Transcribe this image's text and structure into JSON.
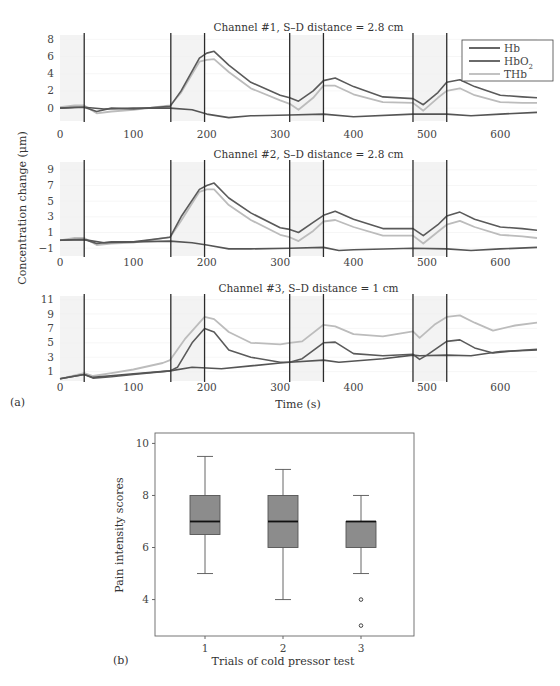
{
  "figure": {
    "panel_a_label": "(a)",
    "panel_b_label": "(b)"
  },
  "chart_data": [
    {
      "type": "line",
      "panel": "a",
      "title": "Channel #1, S–D distance = 2.8 cm",
      "xlabel": "Time (s)",
      "ylabel": "Concentration change (μm)",
      "xlim": [
        0,
        650
      ],
      "ylim": [
        -1.5,
        8.5
      ],
      "xticks": [
        0,
        100,
        200,
        300,
        400,
        500,
        600
      ],
      "yticks": [
        0,
        2,
        4,
        6,
        8
      ],
      "grid": false,
      "vlines": [
        33,
        151,
        197,
        313,
        359,
        481,
        527
      ],
      "shaded_regions": [
        [
          0,
          33
        ],
        [
          151,
          197
        ],
        [
          313,
          359
        ],
        [
          481,
          527
        ]
      ],
      "legend": {
        "position": "upper right",
        "entries": [
          "Hb",
          "HbO2",
          "THb"
        ]
      },
      "series": [
        {
          "name": "Hb",
          "color": "#555555",
          "x": [
            0,
            33,
            60,
            100,
            150,
            180,
            200,
            230,
            260,
            313,
            359,
            400,
            481,
            527,
            560,
            600,
            650
          ],
          "y": [
            0,
            0.1,
            -0.1,
            0,
            0,
            -0.2,
            -0.7,
            -1.1,
            -0.9,
            -0.8,
            -0.7,
            -1.0,
            -0.7,
            -0.7,
            -0.9,
            -0.7,
            -0.5
          ]
        },
        {
          "name": "HbO2",
          "color": "#5a5a5a",
          "x": [
            0,
            20,
            33,
            50,
            70,
            100,
            150,
            165,
            190,
            200,
            210,
            230,
            260,
            300,
            313,
            325,
            345,
            359,
            375,
            400,
            440,
            481,
            495,
            515,
            527,
            545,
            565,
            600,
            630,
            650
          ],
          "y": [
            0,
            0.1,
            0.1,
            -0.4,
            0,
            -0.1,
            0.2,
            2.0,
            5.8,
            6.4,
            6.6,
            5.0,
            3.0,
            1.5,
            1.2,
            0.8,
            2.0,
            3.2,
            3.5,
            2.5,
            1.3,
            1.1,
            0.4,
            1.8,
            3.0,
            3.3,
            2.5,
            1.5,
            1.3,
            1.2
          ]
        },
        {
          "name": "THb",
          "color": "#bcbcbc",
          "x": [
            0,
            20,
            33,
            50,
            70,
            100,
            150,
            165,
            190,
            200,
            210,
            230,
            260,
            300,
            313,
            325,
            345,
            359,
            375,
            400,
            440,
            481,
            495,
            515,
            527,
            545,
            565,
            600,
            630,
            650
          ],
          "y": [
            0.1,
            0.3,
            0.3,
            -0.6,
            -0.4,
            -0.2,
            0.3,
            1.8,
            5.4,
            5.6,
            5.7,
            4.2,
            2.3,
            0.9,
            0.5,
            -0.2,
            1.2,
            2.6,
            2.6,
            1.6,
            0.7,
            0.6,
            -0.3,
            1.2,
            2.0,
            2.3,
            1.5,
            0.7,
            0.6,
            0.6
          ]
        }
      ]
    },
    {
      "type": "line",
      "panel": "a",
      "title": "Channel #2, S–D distance = 2.8 cm",
      "xlim": [
        0,
        650
      ],
      "ylim": [
        -2,
        10
      ],
      "xticks": [
        0,
        100,
        200,
        300,
        400,
        500,
        600
      ],
      "yticks": [
        -1,
        1,
        3,
        5,
        7,
        9
      ],
      "vlines": [
        33,
        151,
        197,
        313,
        359,
        481,
        527
      ],
      "shaded_regions": [
        [
          0,
          33
        ],
        [
          151,
          197
        ],
        [
          313,
          359
        ],
        [
          481,
          527
        ]
      ],
      "series": [
        {
          "name": "Hb",
          "color": "#555555",
          "x": [
            0,
            33,
            60,
            100,
            150,
            180,
            200,
            230,
            260,
            313,
            359,
            380,
            400,
            481,
            527,
            560,
            600,
            650
          ],
          "y": [
            0,
            0.1,
            -0.3,
            -0.2,
            -0.1,
            -0.3,
            -0.6,
            -1.1,
            -1.1,
            -1.0,
            -0.9,
            -1.3,
            -1.2,
            -1.0,
            -1.1,
            -1.3,
            -1.1,
            -0.9
          ]
        },
        {
          "name": "HbO2",
          "color": "#5a5a5a",
          "x": [
            0,
            20,
            33,
            50,
            70,
            100,
            150,
            165,
            190,
            200,
            210,
            230,
            260,
            300,
            313,
            325,
            345,
            359,
            375,
            400,
            440,
            481,
            495,
            515,
            527,
            545,
            565,
            600,
            630,
            650
          ],
          "y": [
            0,
            0.1,
            0.1,
            -0.4,
            -0.2,
            -0.2,
            0.4,
            3.0,
            6.5,
            7.0,
            7.3,
            5.4,
            3.5,
            1.6,
            1.4,
            1.0,
            2.3,
            3.2,
            3.7,
            2.7,
            1.5,
            1.5,
            0.6,
            2.0,
            3.1,
            3.6,
            2.7,
            1.7,
            1.5,
            1.3
          ]
        },
        {
          "name": "THb",
          "color": "#bcbcbc",
          "x": [
            0,
            20,
            33,
            50,
            70,
            100,
            150,
            165,
            190,
            200,
            210,
            230,
            260,
            300,
            313,
            325,
            345,
            359,
            375,
            400,
            440,
            481,
            495,
            515,
            527,
            545,
            565,
            600,
            630,
            650
          ],
          "y": [
            0,
            0.3,
            0.3,
            -0.6,
            -0.4,
            -0.3,
            0.4,
            2.5,
            6.2,
            6.5,
            6.5,
            4.5,
            2.6,
            0.7,
            0.4,
            -0.1,
            1.2,
            2.4,
            2.6,
            1.7,
            0.6,
            0.6,
            -0.4,
            1.1,
            2.0,
            2.5,
            1.7,
            0.7,
            0.5,
            0.3
          ]
        }
      ]
    },
    {
      "type": "line",
      "panel": "a",
      "title": "Channel #3, S–D distance = 1 cm",
      "xlim": [
        0,
        650
      ],
      "ylim": [
        -0.3,
        11.5
      ],
      "xticks": [
        0,
        100,
        200,
        300,
        400,
        500,
        600
      ],
      "yticks": [
        1,
        3,
        5,
        7,
        9,
        11
      ],
      "vlines": [
        33,
        151,
        197,
        313,
        359,
        481,
        527
      ],
      "shaded_regions": [
        [
          0,
          33
        ],
        [
          151,
          197
        ],
        [
          313,
          359
        ],
        [
          481,
          527
        ]
      ],
      "series": [
        {
          "name": "Hb",
          "color": "#555555",
          "x": [
            0,
            33,
            45,
            100,
            150,
            180,
            200,
            220,
            260,
            300,
            313,
            359,
            380,
            440,
            481,
            490,
            527,
            560,
            600,
            650
          ],
          "y": [
            0,
            0.6,
            0.2,
            0.7,
            1.1,
            1.6,
            1.5,
            1.4,
            1.8,
            2.2,
            2.3,
            2.6,
            2.3,
            2.8,
            3.3,
            3.2,
            3.3,
            3.2,
            3.8,
            4.0
          ]
        },
        {
          "name": "HbO2",
          "color": "#5a5a5a",
          "x": [
            0,
            33,
            45,
            70,
            100,
            150,
            160,
            180,
            197,
            210,
            230,
            260,
            300,
            313,
            330,
            359,
            375,
            400,
            440,
            481,
            490,
            500,
            527,
            545,
            565,
            590,
            620,
            650
          ],
          "y": [
            0,
            0.6,
            0.1,
            0.3,
            0.6,
            1.1,
            1.6,
            5.0,
            7.0,
            6.5,
            4.0,
            3.0,
            2.3,
            2.3,
            2.8,
            5.0,
            5.1,
            3.5,
            3.2,
            3.4,
            2.7,
            3.3,
            5.2,
            5.4,
            4.3,
            3.6,
            3.9,
            4.1
          ]
        },
        {
          "name": "THb",
          "color": "#bcbcbc",
          "x": [
            0,
            33,
            45,
            70,
            100,
            140,
            150,
            170,
            197,
            210,
            230,
            260,
            300,
            313,
            330,
            359,
            375,
            400,
            440,
            481,
            490,
            510,
            527,
            545,
            565,
            590,
            620,
            650
          ],
          "y": [
            0,
            0.8,
            0.4,
            0.8,
            1.3,
            2.2,
            2.6,
            5.5,
            8.6,
            8.3,
            6.5,
            5.0,
            4.8,
            5.0,
            5.2,
            7.5,
            7.3,
            6.2,
            5.9,
            6.6,
            5.7,
            7.5,
            8.6,
            8.8,
            7.8,
            6.7,
            7.4,
            7.8
          ]
        }
      ]
    },
    {
      "type": "box",
      "panel": "b",
      "xlabel": "Trials of cold pressor test",
      "ylabel": "Pain intensity scores",
      "categories": [
        "1",
        "2",
        "3"
      ],
      "ylim": [
        2.6,
        10.4
      ],
      "yticks": [
        4,
        6,
        8,
        10
      ],
      "box_color": "#8c8c8c",
      "boxes": [
        {
          "label": "1",
          "whisker_low": 5,
          "q1": 6.5,
          "median": 7,
          "q3": 8,
          "whisker_high": 9.5,
          "outliers": []
        },
        {
          "label": "2",
          "whisker_low": 4,
          "q1": 6,
          "median": 7,
          "q3": 8,
          "whisker_high": 9,
          "outliers": []
        },
        {
          "label": "3",
          "whisker_low": 5,
          "q1": 6,
          "median": 7,
          "q3": 7,
          "whisker_high": 8,
          "outliers": [
            4,
            3
          ]
        }
      ]
    }
  ]
}
